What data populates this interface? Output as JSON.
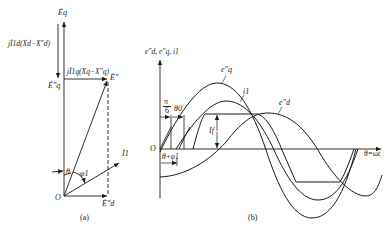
{
  "figure_a": {
    "caption": "(a)",
    "labels": {
      "Eq": "Ėq",
      "jI1d": "jİ1d(Xd−X″d)",
      "Eq_pp": "Ė″q",
      "jI1q": "jİ1q(Xq−X″q)",
      "E_pp": "Ė″",
      "I1": "İ1",
      "theta": "θ",
      "phi1": "φ1",
      "origin": "O",
      "Ed_pp": "Ė″d"
    }
  },
  "figure_b": {
    "caption": "(b)",
    "labels": {
      "y_axis": "e″d, e″q, i1",
      "pi6_num": "π",
      "pi6_den": "6",
      "theta0": "θ0",
      "eq_pp": "e″q",
      "i1": "i1",
      "ed_pp": "e″d",
      "If": "If",
      "origin": "O",
      "theta_phi": "θ+φ1",
      "x_axis": "θ=ωt"
    }
  },
  "colors": {
    "line": "#1a1a1a",
    "background": "#ffffff"
  }
}
